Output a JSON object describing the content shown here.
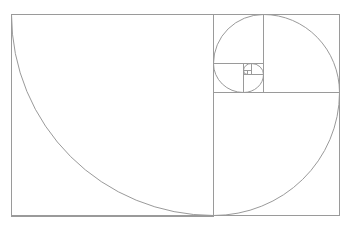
{
  "diagram": {
    "background": "#ffffff",
    "stroke_color": "#9a9a9a",
    "stroke_width": 1,
    "outer_rect": {
      "x": 11,
      "y": 14,
      "w": 328,
      "h": 201
    },
    "squares": [
      {
        "x": 11,
        "y": 14,
        "s": 202
      },
      {
        "x": 213,
        "y": 92,
        "s": 126,
        "h": 123
      },
      {
        "x": 263,
        "y": 14,
        "s": 76,
        "h": 78
      },
      {
        "x": 213,
        "y": 14,
        "s": 50,
        "h": 49
      },
      {
        "x": 213,
        "y": 63,
        "s": 30,
        "h": 29
      },
      {
        "x": 243,
        "y": 74,
        "s": 20,
        "h": 18
      },
      {
        "x": 251,
        "y": 63,
        "s": 12,
        "h": 11
      },
      {
        "x": 243,
        "y": 63,
        "s": 8,
        "h": 7
      },
      {
        "x": 243,
        "y": 70,
        "s": 4,
        "h": 4
      }
    ],
    "arcs": [
      {
        "from": [
          11,
          14
        ],
        "to": [
          213,
          215
        ],
        "rx": 202,
        "ry": 201
      },
      {
        "from": [
          213,
          215
        ],
        "to": [
          339,
          92
        ],
        "rx": 126,
        "ry": 123
      },
      {
        "from": [
          339,
          92
        ],
        "to": [
          263,
          14
        ],
        "rx": 76,
        "ry": 78
      },
      {
        "from": [
          263,
          14
        ],
        "to": [
          213,
          63
        ],
        "rx": 50,
        "ry": 49
      },
      {
        "from": [
          213,
          63
        ],
        "to": [
          243,
          92
        ],
        "rx": 30,
        "ry": 29
      },
      {
        "from": [
          243,
          92
        ],
        "to": [
          263,
          74
        ],
        "rx": 20,
        "ry": 18
      },
      {
        "from": [
          263,
          74
        ],
        "to": [
          251,
          63
        ],
        "rx": 12,
        "ry": 11
      },
      {
        "from": [
          251,
          63
        ],
        "to": [
          243,
          70
        ],
        "rx": 8,
        "ry": 7
      },
      {
        "from": [
          243,
          70
        ],
        "to": [
          247,
          74
        ],
        "rx": 4,
        "ry": 4
      }
    ]
  }
}
